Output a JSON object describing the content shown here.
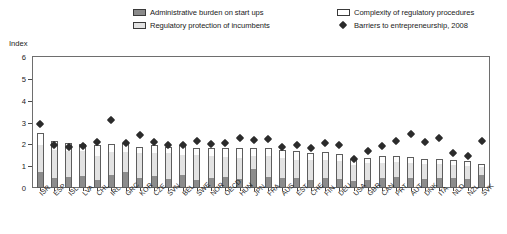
{
  "legend": {
    "items": [
      {
        "id": "admin",
        "label": "Administrative burden on start ups",
        "swatch": "filled-gray-square"
      },
      {
        "id": "protect",
        "label": "Regulatory protection of incumbents",
        "swatch": "light-gray-square"
      },
      {
        "id": "complex",
        "label": "Complexity of regulatory procedures",
        "swatch": "white-square"
      },
      {
        "id": "marker",
        "label": "Barriers to entrepreneurship, 2008",
        "swatch": "black-diamond-marker"
      }
    ]
  },
  "axis": {
    "y_title": "Index",
    "y_ticks": [
      "0",
      "1",
      "2",
      "3",
      "4",
      "5",
      "6"
    ]
  },
  "colors": {
    "admin": "#8c8c8c",
    "protect": "#e3e3e3",
    "complex": "#fdfdfd",
    "marker": "#2b2b2b",
    "frame": "#6e6e6e",
    "background": "#ffffff"
  },
  "chart_data": {
    "type": "bar",
    "title": "",
    "subtitle": "",
    "xlabel": "",
    "ylabel": "Index",
    "ylim": [
      0,
      6
    ],
    "grid": false,
    "stacked": true,
    "legend_position": "top",
    "categories": [
      "ISR",
      "ESP",
      "ISL",
      "LVA",
      "CHL",
      "IRL",
      "GRC",
      "KOR",
      "CZE",
      "SVN",
      "BEL",
      "SWE",
      "NOR",
      "OECD",
      "HUN",
      "JPN",
      "FRA",
      "AUS",
      "EST",
      "CHE",
      "FIN",
      "DEU",
      "USA",
      "GBR",
      "CAN",
      "PRT",
      "AUT",
      "DNK",
      "ITA",
      "NLD",
      "NZL",
      "SVK"
    ],
    "series": [
      {
        "name": "Administrative burden on start ups",
        "values": [
          0.75,
          0.45,
          0.5,
          0.55,
          0.35,
          0.6,
          0.72,
          0.45,
          0.55,
          0.4,
          0.6,
          0.35,
          0.45,
          0.5,
          0.42,
          0.85,
          0.5,
          0.48,
          0.45,
          0.35,
          0.48,
          0.4,
          0.3,
          0.38,
          0.45,
          0.5,
          0.45,
          0.42,
          0.48,
          0.45,
          0.4,
          0.6
        ]
      },
      {
        "name": "Regulatory protection of incumbents",
        "values": [
          1.2,
          1.3,
          1.2,
          1.15,
          1.1,
          1.05,
          0.95,
          1.15,
          1.05,
          1.2,
          0.9,
          1.15,
          1.0,
          0.9,
          0.95,
          0.6,
          0.95,
          0.9,
          0.85,
          0.95,
          0.8,
          0.85,
          0.75,
          0.78,
          0.7,
          0.7,
          0.7,
          0.7,
          0.62,
          0.6,
          0.6,
          0.35
        ]
      },
      {
        "name": "Complexity of regulatory procedures",
        "values": [
          0.55,
          0.4,
          0.35,
          0.32,
          0.5,
          0.35,
          0.38,
          0.3,
          0.35,
          0.3,
          0.45,
          0.35,
          0.4,
          0.45,
          0.45,
          0.4,
          0.38,
          0.35,
          0.4,
          0.3,
          0.35,
          0.33,
          0.3,
          0.22,
          0.3,
          0.25,
          0.28,
          0.22,
          0.25,
          0.22,
          0.25,
          0.15
        ]
      }
    ],
    "marker_series": {
      "name": "Barriers to entrepreneurship, 2008",
      "values": [
        3.05,
        2.1,
        2.0,
        2.05,
        2.25,
        3.25,
        2.2,
        2.55,
        2.25,
        2.1,
        2.1,
        2.3,
        2.15,
        2.2,
        2.45,
        2.35,
        2.4,
        2.0,
        2.1,
        1.95,
        2.2,
        2.1,
        1.45,
        1.85,
        2.05,
        2.3,
        2.6,
        2.25,
        2.45,
        1.75,
        1.6,
        2.3
      ]
    }
  }
}
